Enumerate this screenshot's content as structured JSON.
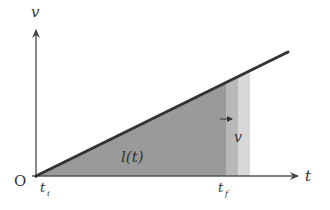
{
  "diagram": {
    "type": "velocity-time graph",
    "axes": {
      "y_label": "v",
      "x_label": "t",
      "origin_label": "O"
    },
    "tick_labels": {
      "start": "t",
      "start_sub": "i",
      "end": "t",
      "end_sub": "f"
    },
    "area_label": "l(t)",
    "moving_edge_label": "v",
    "colors": {
      "line": "#333333",
      "area_dark": "#9a9a9a",
      "area_mid": "#b8b8b8",
      "area_light": "#d6d6d6",
      "axis": "#555555"
    }
  }
}
